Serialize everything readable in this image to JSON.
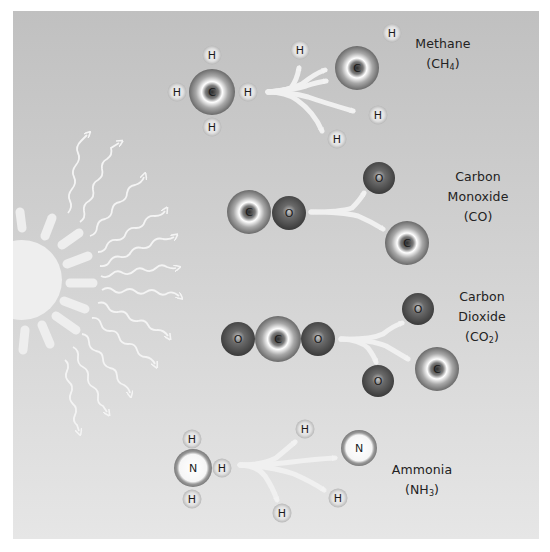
{
  "figure": {
    "background": {
      "top": "#c0c0c0",
      "bottom": "#e6e6e6",
      "margin": "#ffffff"
    },
    "colors": {
      "carbon": "#8a8a8a",
      "oxygen": "#4f4f4f",
      "hydrogen": "#d0d0d0",
      "nitrogen": "#f4f4f4",
      "arrow": "#f0f0f0",
      "sun": "#efefef",
      "text": "#222222"
    }
  },
  "sun": {
    "name": "sun",
    "rays": 9,
    "wave_arrows": 12
  },
  "molecules": [
    {
      "name": "Methane",
      "formula": "CH",
      "formula_sub": "4",
      "intact": {
        "center": "C",
        "bonded": [
          "H",
          "H",
          "H",
          "H"
        ]
      },
      "products": [
        "C",
        "H",
        "H",
        "H",
        "H"
      ]
    },
    {
      "name_line1": "Carbon",
      "name_line2": "Monoxide",
      "formula": "CO",
      "intact": [
        "C",
        "O"
      ],
      "products": [
        "O",
        "C"
      ]
    },
    {
      "name_line1": "Carbon",
      "name_line2": "Dioxide",
      "formula": "CO",
      "formula_sub": "2",
      "intact": [
        "O",
        "C",
        "O"
      ],
      "products": [
        "O",
        "C",
        "O"
      ]
    },
    {
      "name": "Ammonia",
      "formula": "NH",
      "formula_sub": "3",
      "intact": {
        "center": "N",
        "bonded": [
          "H",
          "H",
          "H"
        ]
      },
      "products": [
        "N",
        "H",
        "H",
        "H"
      ]
    }
  ],
  "atoms": {
    "C": "C",
    "O": "O",
    "H": "H",
    "N": "N"
  }
}
